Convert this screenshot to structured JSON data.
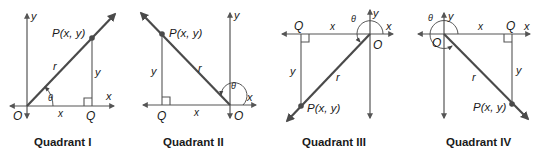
{
  "figure": {
    "panels": [
      {
        "id": "quadrant-1",
        "caption": "Quadrant I",
        "point_label": "P(x, y)",
        "origin_label": "O",
        "foot_label": "Q",
        "x_axis_label": "x",
        "y_axis_label": "y",
        "hyp_label": "r",
        "horiz_side_label": "x",
        "vert_side_label": "y",
        "angle_label": "θ"
      },
      {
        "id": "quadrant-2",
        "caption": "Quadrant II",
        "point_label": "P(x, y)",
        "origin_label": "O",
        "foot_label": "Q",
        "x_axis_label": "x",
        "y_axis_label": "y",
        "hyp_label": "r",
        "horiz_side_label": "x",
        "vert_side_label": "y",
        "angle_label": "θ"
      },
      {
        "id": "quadrant-3",
        "caption": "Quadrant III",
        "point_label": "P(x, y)",
        "origin_label": "O",
        "foot_label": "Q",
        "x_axis_label": "x",
        "y_axis_label": "y",
        "hyp_label": "r",
        "horiz_side_label": "x",
        "vert_side_label": "y",
        "angle_label": "θ"
      },
      {
        "id": "quadrant-4",
        "caption": "Quadrant IV",
        "point_label": "P(x, y)",
        "origin_label": "O",
        "foot_label": "Q",
        "x_axis_label": "x",
        "y_axis_label": "y",
        "hyp_label": "r",
        "horiz_side_label": "x",
        "vert_side_label": "y",
        "angle_label": "θ"
      }
    ],
    "colors": {
      "stroke": "#4a4a4a",
      "text": "#1a1a1a",
      "background": "#ffffff"
    }
  }
}
